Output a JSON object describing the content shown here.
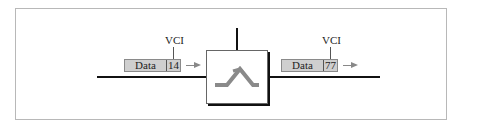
{
  "diagram": {
    "incoming_packet": {
      "data_label": "Data",
      "vci_value": "14",
      "vci_label": "VCI"
    },
    "outgoing_packet": {
      "data_label": "Data",
      "vci_value": "77",
      "vci_label": "VCI"
    },
    "switch": {
      "icon": "switch-crossover-icon"
    },
    "colors": {
      "packet_fill": "#cfcfcf",
      "line": "#111111",
      "arrow": "#888888",
      "switch_glyph": "#8a8a8a"
    }
  }
}
